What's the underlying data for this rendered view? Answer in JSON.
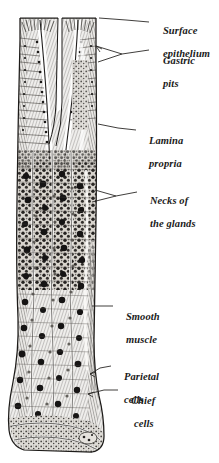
{
  "figure": {
    "style": "engraving",
    "ink_color": "#2b2b2b",
    "background_color": "#ffffff",
    "labels": [
      {
        "id": "surface-epithelium",
        "line1": "Surface",
        "line2": "epithelium"
      },
      {
        "id": "gastric-pits",
        "line1": "Gastric",
        "line2": "pits"
      },
      {
        "id": "lamina-propria",
        "line1": "Lamina",
        "line2": "propria"
      },
      {
        "id": "necks-of-the-glands",
        "line1": "Necks of",
        "line2": "the glands"
      },
      {
        "id": "smooth-muscle",
        "line1": "Smooth",
        "line2": "muscle"
      },
      {
        "id": "parietal-cells",
        "line1": "Parietal",
        "line2": "cells"
      },
      {
        "id": "chief-cells",
        "line1": "Chief",
        "line2": "cells"
      }
    ]
  }
}
